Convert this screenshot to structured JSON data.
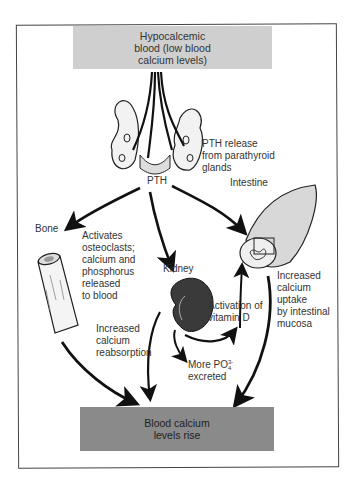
{
  "diagram": {
    "title_box": "Hypocalcemic blood (low blood calcium levels)",
    "title_lines": [
      "Hypocalcemic",
      "blood (low blood",
      "calcium levels)"
    ],
    "gland_label": [
      "PTH release",
      "from parathyroid",
      "glands"
    ],
    "hormone": "PTH",
    "targets": {
      "bone": {
        "label": "Bone",
        "effect": [
          "Activates",
          "osteoclasts;",
          "calcium and",
          "phosphorus",
          "released",
          "to blood"
        ]
      },
      "kidney": {
        "label": "Kidney",
        "effects": {
          "reabsorption": [
            "Increased",
            "calcium",
            "reabsorption"
          ],
          "phosphate": [
            "More PO",
            "excreted"
          ],
          "phosphate_super": "3-",
          "phosphate_sub": "4",
          "vitamin_d": [
            "Activation of",
            "vitamin D"
          ]
        }
      },
      "intestine": {
        "label": "Intestine",
        "effect": [
          "Increased",
          "calcium",
          "uptake",
          "by intestinal",
          "mucosa"
        ]
      }
    },
    "result_box": [
      "Blood calcium",
      "levels rise"
    ],
    "colors": {
      "top_box": "#cfcfcf",
      "bottom_box": "#8a8a8a",
      "arrows": "#111111",
      "frame": "#444444",
      "kidney": "#3a3a3a"
    }
  }
}
